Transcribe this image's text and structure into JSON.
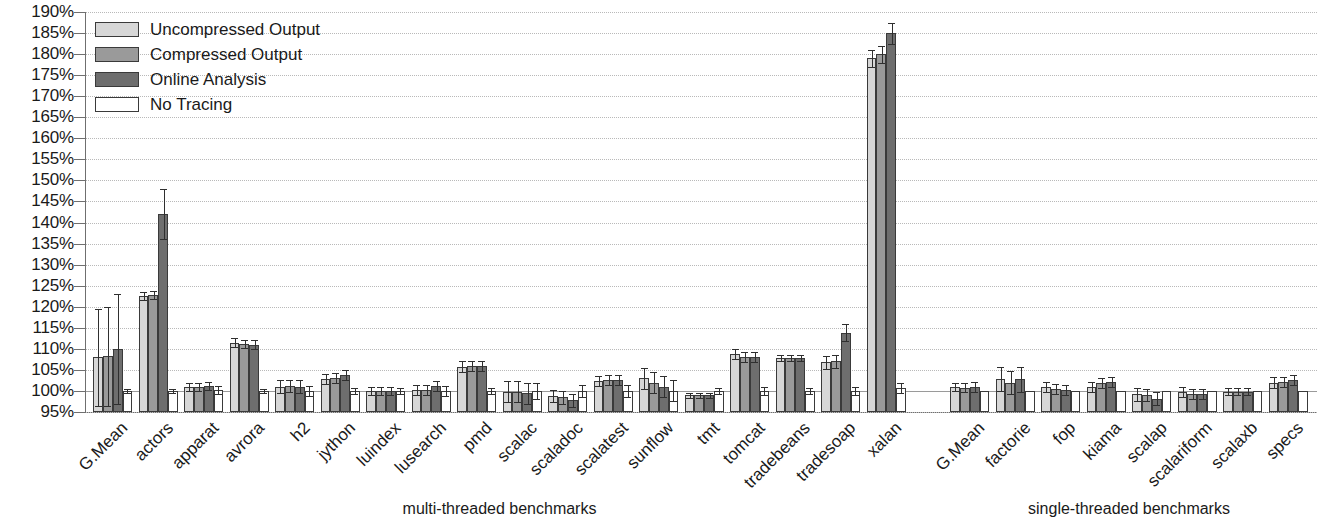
{
  "chart_data": {
    "type": "bar",
    "title": "",
    "xlabel": "",
    "ylabel": "",
    "ylim": [
      95,
      190
    ],
    "ytick_step": 5,
    "grid": true,
    "legend_position": "top-left",
    "ytick_labels": [
      "190%",
      "185%",
      "180%",
      "175%",
      "170%",
      "165%",
      "160%",
      "155%",
      "150%",
      "145%",
      "140%",
      "135%",
      "130%",
      "125%",
      "120%",
      "115%",
      "110%",
      "105%",
      "100%",
      "95%"
    ],
    "baseline": 100,
    "legend": [
      {
        "name": "Uncompressed Output",
        "color": "#d7d7d7"
      },
      {
        "name": "Compressed Output",
        "color": "#9a9a9a"
      },
      {
        "name": "Online Analysis",
        "color": "#6e6e6e"
      },
      {
        "name": "No Tracing",
        "color": "#ffffff"
      }
    ],
    "panels": [
      {
        "caption": "multi-threaded benchmarks",
        "categories": [
          "G.Mean",
          "actors",
          "apparat",
          "avrora",
          "h2",
          "jython",
          "luindex",
          "lusearch",
          "pmd",
          "scalac",
          "scaladoc",
          "scalatest",
          "sunflow",
          "tmt",
          "tomcat",
          "tradebeans",
          "tradesoap",
          "xalan"
        ],
        "series": [
          {
            "name": "Uncompressed Output",
            "values": [
              108.0,
              122.5,
              101.0,
              111.5,
              101.0,
              102.8,
              100.0,
              100.2,
              105.8,
              99.8,
              98.8,
              102.3,
              103.0,
              99.0,
              108.8,
              107.8,
              106.8,
              179.0
            ],
            "errors": [
              11.5,
              1.0,
              1.0,
              1.0,
              1.5,
              1.2,
              1.0,
              1.2,
              1.2,
              2.5,
              1.5,
              1.2,
              2.5,
              0.6,
              1.2,
              0.8,
              1.5,
              2.0
            ]
          },
          {
            "name": "Compressed Output",
            "values": [
              108.2,
              122.8,
              101.0,
              111.2,
              101.2,
              103.0,
              100.0,
              100.3,
              106.0,
              99.8,
              98.5,
              102.5,
              102.0,
              99.0,
              108.0,
              107.8,
              107.0,
              180.0
            ],
            "errors": [
              11.8,
              1.0,
              1.0,
              1.0,
              1.5,
              1.2,
              1.0,
              1.2,
              1.2,
              2.5,
              1.5,
              1.2,
              2.5,
              0.6,
              1.2,
              0.8,
              1.5,
              2.0
            ]
          },
          {
            "name": "Online Analysis",
            "values": [
              110.0,
              142.0,
              101.2,
              111.0,
              101.0,
              103.8,
              100.0,
              101.2,
              106.0,
              99.5,
              97.8,
              102.5,
              101.0,
              99.0,
              108.0,
              107.8,
              113.8,
              185.0
            ],
            "errors": [
              13.0,
              6.0,
              1.0,
              1.0,
              1.5,
              1.2,
              1.0,
              1.2,
              1.2,
              2.5,
              1.5,
              1.2,
              2.5,
              0.6,
              1.2,
              0.8,
              2.0,
              2.5
            ]
          },
          {
            "name": "No Tracing",
            "values": [
              100.0,
              100.0,
              100.2,
              100.0,
              100.0,
              100.0,
              100.0,
              100.0,
              100.0,
              100.0,
              100.0,
              100.0,
              100.0,
              100.0,
              100.0,
              100.0,
              100.0,
              100.8
            ],
            "errors": [
              0.5,
              0.5,
              1.0,
              0.5,
              1.2,
              0.8,
              0.8,
              1.2,
              0.8,
              2.0,
              1.5,
              1.5,
              2.5,
              0.8,
              1.0,
              0.8,
              1.0,
              1.2
            ]
          }
        ]
      },
      {
        "caption": "single-threaded benchmarks",
        "categories": [
          "G.Mean",
          "factorie",
          "fop",
          "kiama",
          "scalap",
          "scalariform",
          "scalaxb",
          "specs"
        ],
        "series": [
          {
            "name": "Uncompressed Output",
            "values": [
              101.0,
              102.8,
              101.0,
              101.0,
              99.2,
              99.8,
              99.8,
              102.0
            ],
            "errors": [
              1.0,
              2.8,
              1.2,
              1.2,
              1.5,
              1.2,
              0.8,
              1.2
            ]
          },
          {
            "name": "Compressed Output",
            "values": [
              100.8,
              102.0,
              100.5,
              101.8,
              99.0,
              99.2,
              99.8,
              102.2
            ],
            "errors": [
              1.0,
              2.8,
              1.2,
              1.2,
              1.5,
              1.2,
              0.8,
              1.2
            ]
          },
          {
            "name": "Online Analysis",
            "values": [
              101.0,
              102.8,
              100.2,
              102.2,
              98.2,
              99.2,
              99.8,
              102.5
            ],
            "errors": [
              1.2,
              3.0,
              1.2,
              1.2,
              1.5,
              1.2,
              0.8,
              1.2
            ]
          },
          {
            "name": "No Tracing",
            "values": [
              100.0,
              100.0,
              100.0,
              100.0,
              100.0,
              100.0,
              100.0,
              100.0
            ]
          }
        ]
      }
    ]
  }
}
